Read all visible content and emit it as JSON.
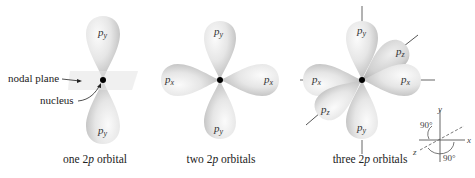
{
  "figure": {
    "panels": [
      {
        "id": "one",
        "caption_prefix": "one 2",
        "caption_italic": "p",
        "caption_suffix": " orbital",
        "lobes": [
          {
            "axis": "y",
            "direction": "up",
            "label": "p",
            "subscript": "y"
          },
          {
            "axis": "y",
            "direction": "down",
            "label": "p",
            "subscript": "y"
          }
        ],
        "annotations": {
          "nodal_plane": "nodal plane",
          "nucleus": "nucleus"
        }
      },
      {
        "id": "two",
        "caption_prefix": "two 2",
        "caption_italic": "p",
        "caption_suffix": " orbitals",
        "lobes": [
          {
            "axis": "y",
            "direction": "up",
            "label": "p",
            "subscript": "y"
          },
          {
            "axis": "y",
            "direction": "down",
            "label": "p",
            "subscript": "y"
          },
          {
            "axis": "x",
            "direction": "left",
            "label": "p",
            "subscript": "x"
          },
          {
            "axis": "x",
            "direction": "right",
            "label": "p",
            "subscript": "x"
          }
        ]
      },
      {
        "id": "three",
        "caption_prefix": "three 2",
        "caption_italic": "p",
        "caption_suffix": " orbitals",
        "lobes": [
          {
            "axis": "y",
            "direction": "up",
            "label": "p",
            "subscript": "y"
          },
          {
            "axis": "y",
            "direction": "down",
            "label": "p",
            "subscript": "y"
          },
          {
            "axis": "x",
            "direction": "left",
            "label": "p",
            "subscript": "x"
          },
          {
            "axis": "x",
            "direction": "right",
            "label": "p",
            "subscript": "x"
          },
          {
            "axis": "z",
            "direction": "back-upper-right",
            "label": "p",
            "subscript": "z"
          },
          {
            "axis": "z",
            "direction": "front-lower-left",
            "label": "p",
            "subscript": "z"
          }
        ]
      }
    ],
    "axes_key": {
      "x_label": "x",
      "y_label": "y",
      "z_label": "z",
      "angle_xy": "90°",
      "angle_xz": "90°"
    },
    "colors": {
      "lobe_light": "#f4f4f4",
      "lobe_mid": "#d8d8d8",
      "lobe_dark": "#a9a9a9",
      "nucleus": "#000000",
      "nodal_plane": "#ececec",
      "axis_line": "#555555"
    }
  }
}
